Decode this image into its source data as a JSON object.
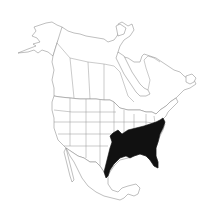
{
  "map": {
    "type": "species-range-map",
    "region": "North America",
    "background_color": "#ffffff",
    "outline_color": "#8a8a8a",
    "range": {
      "label": "distribution range",
      "fill_color": "#111111",
      "area_description": "Southeastern United States: from eastern Texas and Oklahoma east through the Gulf states and Florida, north to Missouri, Kentucky, Virginia and the mid-Atlantic coast"
    },
    "visible_text": []
  }
}
